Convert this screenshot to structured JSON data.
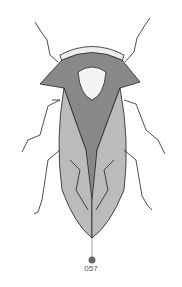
{
  "figure": {
    "callout_label": "057",
    "callout_color": "#666666",
    "line_color": "#222222"
  }
}
